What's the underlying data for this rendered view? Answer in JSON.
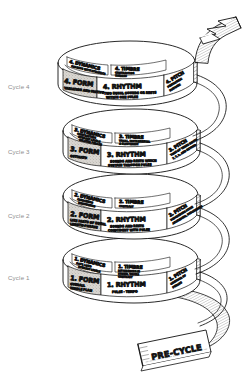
{
  "diagram": {
    "background_color": "#ffffff",
    "ink_color": "#111111",
    "panel_fill_color": "#d8d5d0",
    "axis_label_color": "#8d8d8d"
  },
  "axis_labels": [
    {
      "label": "Cycle 4"
    },
    {
      "label": "Cycle 3"
    },
    {
      "label": "Cycle 2"
    },
    {
      "label": "Cycle 1"
    }
  ],
  "cycles": [
    {
      "id": "cycle-4",
      "axis_label": "Cycle 4",
      "form": {
        "heading": "4. FORM",
        "detail": "VARIATION AND MOTIVE"
      },
      "rhythm": {
        "heading": "4. RHYTHM",
        "detail_line1": "TWO EQUAL SOUNDS OR RESTS",
        "detail_line2": "WITHIN ONE PULSE"
      },
      "pitch": {
        "heading": "4. PITCH",
        "detail_line1": "PENTATONIC",
        "detail_line2": "DIATONIC"
      },
      "dynamics": {
        "heading": "4. DYNAMICS",
        "detail": "SHADING WITH DYNAMICS"
      },
      "timbre": {
        "heading": "4. TIMBRE",
        "detail_line1": "CONTRASTING",
        "detail_line2": "TIMBRES"
      }
    },
    {
      "id": "cycle-3",
      "axis_label": "Cycle 3",
      "form": {
        "heading": "3. FORM",
        "detail": "OSTINATO"
      },
      "rhythm": {
        "heading": "3. RHYTHM",
        "detail_line1": "SOUNDS AND RESTS WHICH",
        "detail_line2": "SUSTAIN THROUGH PULSE"
      },
      "pitch": {
        "heading": "3. PITCH",
        "detail_line1": "TONE OF THREE NOTES",
        "detail_line2": "7, 7, 3, AND BEYOND"
      },
      "dynamics": {
        "heading": "3. DYNAMICS",
        "detail_line1": "CONTRASTING",
        "detail_line2": "DYNAMIC LEVELS",
        "detail_line3": "RELATED PHRASE"
      },
      "timbre": {
        "heading": "3. TIMBRE",
        "detail_line1": "VOCAL, INSTRUMENTAL",
        "detail_line2": "& ELECTRONIC"
      }
    },
    {
      "id": "cycle-2",
      "axis_label": "Cycle 2",
      "form": {
        "heading": "2. FORM",
        "detail_line1": "LIKE PARTS OF EQUAL",
        "detail_line2": "LENGTH-PHRASE"
      },
      "rhythm": {
        "heading": "2. RHYTHM",
        "detail_line1": "SOUNDS AND RESTS",
        "detail_line2": "COINCIDENT WITH PULSE"
      },
      "pitch": {
        "heading": "2. PITCH",
        "detail_line1": "DESCENDING PITCH",
        "detail_line2": "ASCENDING, DESCENDING"
      },
      "dynamics": {
        "heading": "2. DYNAMICS",
        "detail_line1": "CRESCENDO",
        "detail_line2": "DIMINUENDO"
      },
      "timbre": {
        "heading": "2. TIMBRE",
        "detail": "CONTRAST"
      }
    },
    {
      "id": "cycle-1",
      "axis_label": "Cycle 1",
      "form": {
        "heading": "1. FORM",
        "detail_line1": "OVERALL",
        "detail_line2": "WHOLE PLAN"
      },
      "rhythm": {
        "heading": "1. RHYTHM",
        "detail": "PULSE - TEMPO"
      },
      "pitch": {
        "heading": "1. PITCH",
        "detail_line1": "CONTOUR OF",
        "detail_line2": "PHRASE"
      },
      "dynamics": {
        "heading": "1. DYNAMICS",
        "detail_line1": "SOFT, LOUD",
        "detail_line2": "DYNAMIC LEVELS"
      },
      "timbre": {
        "heading": "1. TIMBRE",
        "detail_line1": "DIFFERENCES IN",
        "detail_line2": "SOUND, VOICES",
        "detail_line3": "CONTRAST"
      }
    }
  ],
  "pre_cycle": {
    "label": "PRE-CYCLE"
  }
}
